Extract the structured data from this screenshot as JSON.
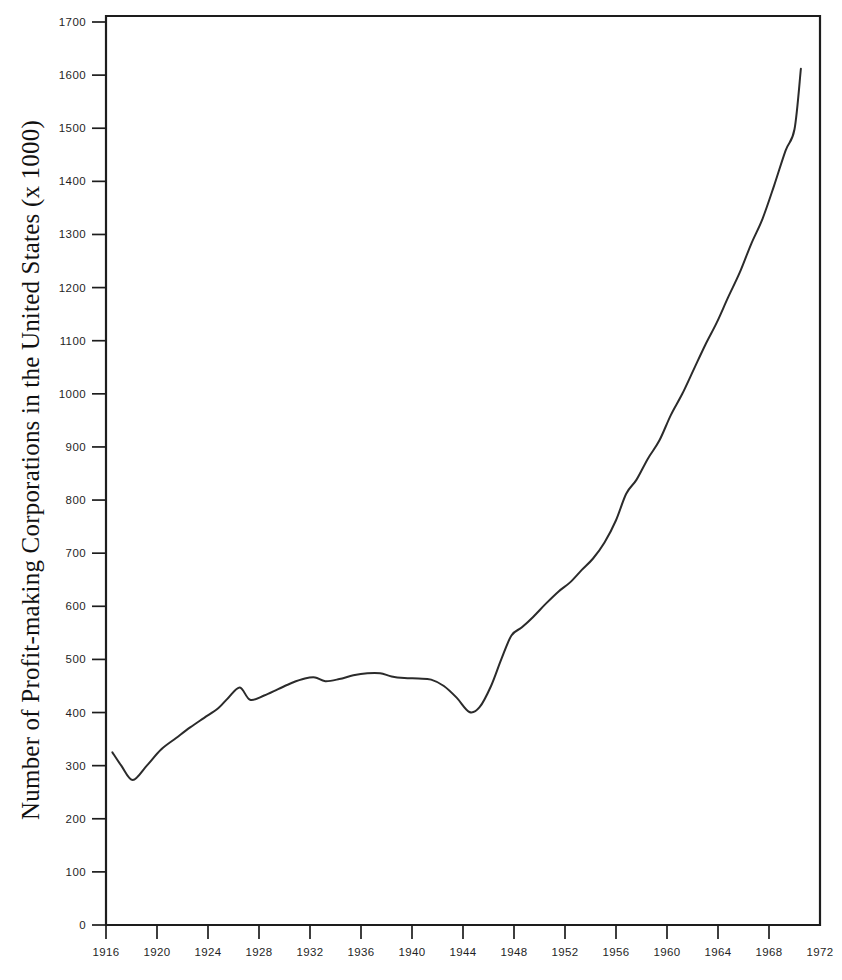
{
  "chart_data": {
    "type": "line",
    "title": "",
    "subtitle": "",
    "xlabel": "",
    "ylabel": "Number of Profit-making Corporations in the United States (x 1000)",
    "xlim": [
      1916,
      1972
    ],
    "ylim": [
      0,
      1700
    ],
    "grid": false,
    "legend": "none",
    "x_ticks": [
      1916,
      1920,
      1924,
      1928,
      1932,
      1936,
      1940,
      1944,
      1948,
      1952,
      1956,
      1960,
      1964,
      1968,
      1972
    ],
    "x_tick_labels": [
      "1916",
      "1920",
      "1924",
      "1928",
      "1932",
      "1936",
      "1940",
      "1944",
      "1948",
      "1952",
      "1956",
      "1960",
      "1964",
      "1968",
      "1972"
    ],
    "y_ticks": [
      0,
      100,
      200,
      300,
      400,
      500,
      600,
      700,
      800,
      900,
      1000,
      1100,
      1200,
      1300,
      1400,
      1500,
      1600,
      1700
    ],
    "y_tick_labels": [
      "0",
      "100",
      "200",
      "300",
      "400",
      "500",
      "600",
      "700",
      "800",
      "900",
      "1000",
      "1100",
      "1200",
      "1300",
      "1400",
      "1500",
      "1600",
      "1700"
    ],
    "series": [
      {
        "name": "Profit-making corporations",
        "color": "#2b2b2b",
        "x": [
          1916.5,
          1917.2,
          1918.1,
          1919.2,
          1920.3,
          1921.5,
          1922.6,
          1923.7,
          1924.8,
          1925.6,
          1926.5,
          1927.3,
          1928.4,
          1929.5,
          1930.6,
          1931.6,
          1932.4,
          1933.2,
          1934.3,
          1935.4,
          1936.5,
          1937.5,
          1938.4,
          1939.4,
          1940.5,
          1941.5,
          1942.5,
          1943.5,
          1944.5,
          1945.3,
          1946.2,
          1947.0,
          1947.8,
          1948.6,
          1949.5,
          1950.5,
          1951.5,
          1952.4,
          1953.3,
          1954.2,
          1955.1,
          1956.0,
          1956.8,
          1957.6,
          1958.5,
          1959.4,
          1960.3,
          1961.2,
          1962.1,
          1963.0,
          1963.9,
          1964.8,
          1965.7,
          1966.6,
          1967.5,
          1968.4,
          1969.3,
          1970.0,
          1970.5
        ],
        "y": [
          325,
          300,
          273,
          300,
          330,
          352,
          372,
          390,
          408,
          428,
          447,
          424,
          432,
          444,
          456,
          464,
          466,
          459,
          463,
          470,
          474,
          474,
          468,
          465,
          464,
          462,
          450,
          428,
          401,
          410,
          450,
          500,
          545,
          560,
          580,
          605,
          628,
          645,
          668,
          690,
          720,
          762,
          812,
          838,
          878,
          912,
          960,
          1000,
          1046,
          1092,
          1134,
          1182,
          1228,
          1282,
          1330,
          1392,
          1458,
          1498,
          1612
        ]
      }
    ],
    "annotations": []
  },
  "axis": {
    "y_title": "Number of Profit-making Corporations in the United States (x 1000)"
  }
}
